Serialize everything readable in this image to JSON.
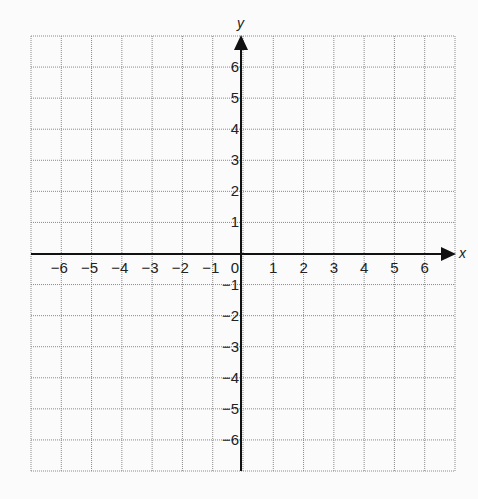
{
  "chart_data": {
    "type": "scatter",
    "title": "",
    "xlabel": "x",
    "ylabel": "y",
    "xlim": [
      -7,
      7
    ],
    "ylim": [
      -7,
      7
    ],
    "grid": true,
    "grid_style": "dotted",
    "x_ticks": [
      -6,
      -5,
      -4,
      -3,
      -2,
      -1,
      0,
      1,
      2,
      3,
      4,
      5,
      6
    ],
    "x_tick_labels": [
      "−6",
      "−5",
      "−4",
      "−3",
      "−2",
      "−1",
      "0",
      "1",
      "2",
      "3",
      "4",
      "5",
      "6"
    ],
    "y_ticks": [
      6,
      5,
      4,
      3,
      2,
      1,
      -1,
      -2,
      -3,
      -4,
      -5,
      -6
    ],
    "y_tick_labels": [
      "6",
      "5",
      "4",
      "3",
      "2",
      "1",
      "−1",
      "−2",
      "−3",
      "−4",
      "−5",
      "−6"
    ],
    "series": [],
    "arrows": {
      "x_positive": true,
      "y_positive": true
    },
    "colors": {
      "axis": "#111111",
      "grid": "#8a8a8a",
      "background": "#fbfbfb"
    }
  }
}
